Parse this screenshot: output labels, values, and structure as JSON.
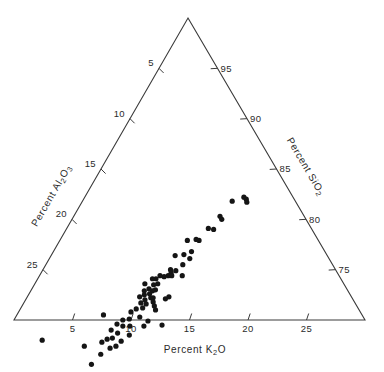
{
  "chart_data": {
    "type": "scatter",
    "plot_kind": "ternary-diagram",
    "title": "",
    "axes": {
      "bottom": {
        "label": "Percent  K2O",
        "label_plain": "Percent K2O",
        "base": "Percent",
        "species": "K",
        "species_sub": "2",
        "species_tail": "O",
        "ticks": [
          5,
          10,
          15,
          20,
          25
        ],
        "tick_labels": [
          "5",
          "10",
          "15",
          "20",
          "25"
        ],
        "range": [
          0,
          30
        ],
        "direction": "left-to-right"
      },
      "left": {
        "label": "Percent Al2O3",
        "base": "Percent",
        "species": "Al",
        "species_sub": "2",
        "species_mid": "O",
        "species_sub2": "3",
        "ticks": [
          5,
          10,
          15,
          20,
          25
        ],
        "tick_labels": [
          "5",
          "10",
          "15",
          "20",
          "25"
        ],
        "range": [
          0,
          30
        ],
        "direction": "top-to-bottom"
      },
      "right": {
        "label": "Percent SiO2",
        "base": "Percent",
        "species": "SiO",
        "species_sub": "2",
        "ticks": [
          95,
          90,
          85,
          80,
          75
        ],
        "tick_labels": [
          "95",
          "90",
          "85",
          "80",
          "75"
        ],
        "range": [
          70,
          100
        ],
        "direction": "top-to-bottom"
      }
    },
    "grid": false,
    "legend": null,
    "marker": {
      "shape": "circle",
      "color": "#151515",
      "size_px": 3.4
    },
    "n_points": 72,
    "series": [
      {
        "name": "samples",
        "note": "each point is one analysis; components normalized to K2O + Al2O3 + SiO2 = 100",
        "points": [
          {
            "k2o": 13.6,
            "al2o3": 4.2,
            "sio2": 82.2
          },
          {
            "k2o": 13.9,
            "al2o3": 4.1,
            "sio2": 82.0
          },
          {
            "k2o": 14.1,
            "al2o3": 4.2,
            "sio2": 81.7
          },
          {
            "k2o": 12.8,
            "al2o3": 5.4,
            "sio2": 81.8
          },
          {
            "k2o": 12.5,
            "al2o3": 7.2,
            "sio2": 80.3
          },
          {
            "k2o": 12.8,
            "al2o3": 7.2,
            "sio2": 80.0
          },
          {
            "k2o": 12.6,
            "al2o3": 8.4,
            "sio2": 79.0
          },
          {
            "k2o": 12.1,
            "al2o3": 8.8,
            "sio2": 79.1
          },
          {
            "k2o": 11.6,
            "al2o3": 10.4,
            "sio2": 78.0
          },
          {
            "k2o": 11.9,
            "al2o3": 10.2,
            "sio2": 77.9
          },
          {
            "k2o": 10.9,
            "al2o3": 11.2,
            "sio2": 77.9
          },
          {
            "k2o": 11.8,
            "al2o3": 11.4,
            "sio2": 76.8
          },
          {
            "k2o": 12.0,
            "al2o3": 11.9,
            "sio2": 76.1
          },
          {
            "k2o": 11.3,
            "al2o3": 12.2,
            "sio2": 76.5
          },
          {
            "k2o": 12.2,
            "al2o3": 13.4,
            "sio2": 74.4
          },
          {
            "k2o": 11.4,
            "al2o3": 13.7,
            "sio2": 74.9
          },
          {
            "k2o": 10.9,
            "al2o3": 14.1,
            "sio2": 75.0
          },
          {
            "k2o": 11.1,
            "al2o3": 14.2,
            "sio2": 74.7
          },
          {
            "k2o": 11.3,
            "al2o3": 14.3,
            "sio2": 74.4
          },
          {
            "k2o": 11.0,
            "al2o3": 14.6,
            "sio2": 74.4
          },
          {
            "k2o": 10.7,
            "al2o3": 15.0,
            "sio2": 74.3
          },
          {
            "k2o": 10.3,
            "al2o3": 15.3,
            "sio2": 74.4
          },
          {
            "k2o": 10.1,
            "al2o3": 15.8,
            "sio2": 74.1
          },
          {
            "k2o": 10.5,
            "al2o3": 15.9,
            "sio2": 73.6
          },
          {
            "k2o": 9.8,
            "al2o3": 16.1,
            "sio2": 74.1
          },
          {
            "k2o": 10.2,
            "al2o3": 16.3,
            "sio2": 73.5
          },
          {
            "k2o": 10.6,
            "al2o3": 16.4,
            "sio2": 73.0
          },
          {
            "k2o": 10.4,
            "al2o3": 16.7,
            "sio2": 72.9
          },
          {
            "k2o": 10.0,
            "al2o3": 16.9,
            "sio2": 73.1
          },
          {
            "k2o": 10.3,
            "al2o3": 17.1,
            "sio2": 72.6
          },
          {
            "k2o": 10.6,
            "al2o3": 17.2,
            "sio2": 72.2
          },
          {
            "k2o": 10.8,
            "al2o3": 17.0,
            "sio2": 72.2
          },
          {
            "k2o": 11.0,
            "al2o3": 17.2,
            "sio2": 71.8
          },
          {
            "k2o": 11.3,
            "al2o3": 17.3,
            "sio2": 71.4
          },
          {
            "k2o": 11.6,
            "al2o3": 17.4,
            "sio2": 71.0
          },
          {
            "k2o": 9.7,
            "al2o3": 17.4,
            "sio2": 72.9
          },
          {
            "k2o": 9.4,
            "al2o3": 17.0,
            "sio2": 73.6
          },
          {
            "k2o": 9.9,
            "al2o3": 17.6,
            "sio2": 72.5
          },
          {
            "k2o": 10.2,
            "al2o3": 17.8,
            "sio2": 72.0
          },
          {
            "k2o": 10.5,
            "al2o3": 17.9,
            "sio2": 71.6
          },
          {
            "k2o": 9.6,
            "al2o3": 18.1,
            "sio2": 72.3
          },
          {
            "k2o": 10.0,
            "al2o3": 18.3,
            "sio2": 71.7
          },
          {
            "k2o": 10.4,
            "al2o3": 18.4,
            "sio2": 71.2
          },
          {
            "k2o": 12.9,
            "al2o3": 17.6,
            "sio2": 69.5
          },
          {
            "k2o": 9.9,
            "al2o3": 19.0,
            "sio2": 71.1
          },
          {
            "k2o": 10.6,
            "al2o3": 19.1,
            "sio2": 70.3
          },
          {
            "k2o": 11.4,
            "al2o3": 19.2,
            "sio2": 69.4
          },
          {
            "k2o": 9.6,
            "al2o3": 19.6,
            "sio2": 70.8
          },
          {
            "k2o": 9.8,
            "al2o3": 20.1,
            "sio2": 70.1
          },
          {
            "k2o": 10.2,
            "al2o3": 20.4,
            "sio2": 69.4
          },
          {
            "k2o": 9.3,
            "al2o3": 20.7,
            "sio2": 70.0
          },
          {
            "k2o": 9.6,
            "al2o3": 21.0,
            "sio2": 69.4
          },
          {
            "k2o": 10.6,
            "al2o3": 20.9,
            "sio2": 68.5
          },
          {
            "k2o": 9.0,
            "al2o3": 21.4,
            "sio2": 69.6
          },
          {
            "k2o": 9.5,
            "al2o3": 21.8,
            "sio2": 68.7
          },
          {
            "k2o": 10.2,
            "al2o3": 21.9,
            "sio2": 67.9
          },
          {
            "k2o": 8.8,
            "al2o3": 22.2,
            "sio2": 69.0
          },
          {
            "k2o": 9.3,
            "al2o3": 22.5,
            "sio2": 68.2
          },
          {
            "k2o": 10.0,
            "al2o3": 22.6,
            "sio2": 67.4
          },
          {
            "k2o": 7.4,
            "al2o3": 22.1,
            "sio2": 70.5
          },
          {
            "k2o": 8.9,
            "al2o3": 23.0,
            "sio2": 68.1
          },
          {
            "k2o": 9.6,
            "al2o3": 23.2,
            "sio2": 67.2
          },
          {
            "k2o": 8.6,
            "al2o3": 23.6,
            "sio2": 67.8
          },
          {
            "k2o": 9.1,
            "al2o3": 24.3,
            "sio2": 66.6
          },
          {
            "k2o": 7.3,
            "al2o3": 25.3,
            "sio2": 67.4
          },
          {
            "k2o": 8.8,
            "al2o3": 25.6,
            "sio2": 65.6
          },
          {
            "k2o": 3.4,
            "al2o3": 28.6,
            "sio2": 68.0
          },
          {
            "k2o": 11.9,
            "al2o3": 16.0,
            "sio2": 72.1
          },
          {
            "k2o": 12.1,
            "al2o3": 15.6,
            "sio2": 72.3
          },
          {
            "k2o": 11.7,
            "al2o3": 12.8,
            "sio2": 75.5
          },
          {
            "k2o": 10.6,
            "al2o3": 13.0,
            "sio2": 76.4
          },
          {
            "k2o": 11.5,
            "al2o3": 18.6,
            "sio2": 69.9
          }
        ]
      }
    ]
  },
  "geometry": {
    "apex": [
      188,
      18
    ],
    "bottom_left": [
      14,
      320
    ],
    "bottom_right": [
      365,
      320
    ],
    "axis_min": 0,
    "axis_max": 30,
    "tick_length": 6
  },
  "colors": {
    "line": "#3a3a3a",
    "text": "#2b2b2b",
    "marker": "#151515",
    "background": "#ffffff"
  }
}
